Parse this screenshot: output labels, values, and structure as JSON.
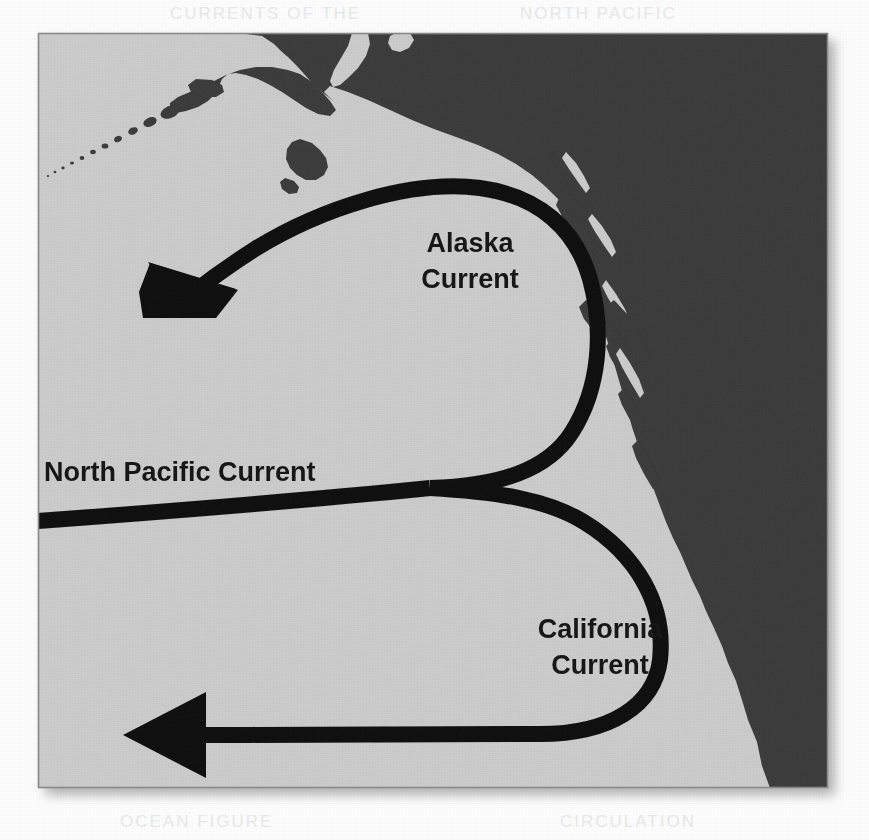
{
  "figure": {
    "kind": "ocean-current-map",
    "region": "Northeast Pacific Ocean / Gulf of Alaska to Baja California",
    "alt": "Scanned grayscale map of the northeastern Pacific Ocean showing three labeled ocean current arrows"
  },
  "colors": {
    "page_background": "#fdfdfd",
    "ocean": "#cdcdcd",
    "land": "#3a3a3a",
    "arrow": "#0d0d0d",
    "map_border": "#8a8a8a",
    "shadow": "#b9b9b9",
    "label_text": "#141414"
  },
  "map": {
    "frame": {
      "x": 38,
      "y": 33,
      "width": 790,
      "height": 755
    },
    "ocean_label": "Pacific Ocean",
    "land_label": "North American landmass"
  },
  "labels": {
    "alaska": {
      "line1": "Alaska",
      "line2": "Current",
      "x": 470,
      "y": 248,
      "font_size": 27
    },
    "north_pacific": {
      "line1": "North Pacific Current",
      "x": 44,
      "y": 474,
      "font_size": 27
    },
    "california": {
      "line1": "California",
      "line2": "Current",
      "x": 600,
      "y": 630,
      "font_size": 27
    }
  },
  "currents": [
    {
      "id": "alaska-current",
      "name": "Alaska Current",
      "direction": "counterclockwise, flowing west-northwest out of the Gulf of Alaska",
      "arrowhead": "west-northwest",
      "arrow_tip_x": 148,
      "arrow_tip_y": 262
    },
    {
      "id": "north-pacific-current",
      "name": "North Pacific Current",
      "direction": "eastward across the open ocean toward the North American coast",
      "arrowhead": "none",
      "entry_x": 38,
      "entry_y": 521
    },
    {
      "id": "california-current",
      "name": "California Current",
      "direction": "southward along the coast then westward offshore",
      "arrowhead": "west",
      "arrow_tip_x": 123,
      "arrow_tip_y": 735
    }
  ],
  "ghost_artifacts": [
    {
      "text": "CURRENTS OF THE",
      "x": 170,
      "y": 6
    },
    {
      "text": "NORTH PACIFIC",
      "x": 520,
      "y": 6
    },
    {
      "text": "OCEAN  FIGURE",
      "x": 120,
      "y": 814
    },
    {
      "text": "CIRCULATION",
      "x": 560,
      "y": 814
    }
  ]
}
